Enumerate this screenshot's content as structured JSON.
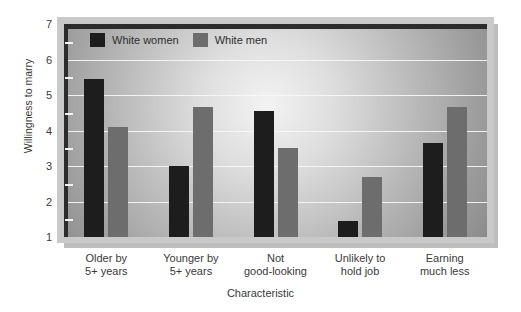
{
  "chart_data": {
    "type": "bar",
    "title": "",
    "xlabel": "Characteristic",
    "ylabel": "Willingness to marry",
    "ylim": [
      1,
      7
    ],
    "ytick_labels": [
      "7",
      "6",
      "5",
      "4",
      "3",
      "2",
      "1"
    ],
    "ytick_values": [
      7,
      6,
      5,
      4,
      3,
      2,
      1
    ],
    "minor_ticks": [
      1.5,
      2.5,
      3.5,
      4.5,
      5.5,
      6.5
    ],
    "grid": true,
    "legend_position": "top-left inside plot",
    "categories": [
      "Older by\n5+ years",
      "Younger by\n5+ years",
      "Not\ngood-looking",
      "Unlikely to\nhold job",
      "Earning\nmuch less"
    ],
    "category_lines": [
      [
        "Older by",
        "5+ years"
      ],
      [
        "Younger by",
        "5+ years"
      ],
      [
        "Not",
        "good-looking"
      ],
      [
        "Unlikely to",
        "hold job"
      ],
      [
        "Earning",
        "much less"
      ]
    ],
    "series": [
      {
        "name": "White women",
        "color": "#1d1d1d",
        "values": [
          5.45,
          3.0,
          4.55,
          1.45,
          3.65
        ]
      },
      {
        "name": "White men",
        "color": "#6d6d6d",
        "values": [
          4.1,
          4.65,
          3.5,
          2.7,
          4.65
        ]
      }
    ]
  },
  "legend": {
    "entries": [
      {
        "label": "White women"
      },
      {
        "label": "White men"
      }
    ]
  },
  "axes": {
    "y_title": "Willingness to marry",
    "x_title": "Characteristic"
  },
  "colors": {
    "series_women": "#1d1d1d",
    "series_men": "#6d6d6d",
    "gridline": "#f7f7f7",
    "frame": "#c9c9c9",
    "inner_border": "#2c2c2c",
    "text": "#3a3a3a"
  }
}
